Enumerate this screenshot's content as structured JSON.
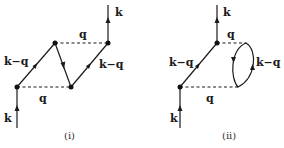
{
  "diagrams": [
    {
      "caption": "(i)",
      "labels": {
        "k_top": "k",
        "q_top": "q",
        "kq_left": "k−q",
        "kq_right": "k−q",
        "q_bottom": "q",
        "k_bottom": "k"
      }
    },
    {
      "caption": "(ii)",
      "labels": {
        "k_top": "k",
        "q_top": "q",
        "kq_left": "k−q",
        "kq_loop": "k−q",
        "q_bottom": "q",
        "k_bottom": "k"
      }
    }
  ],
  "colors": {
    "line": "#1a1a1a",
    "background": "#ffffff"
  }
}
